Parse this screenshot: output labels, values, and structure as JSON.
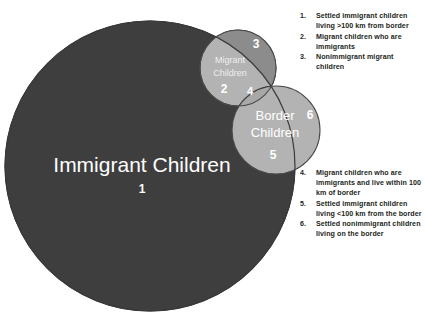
{
  "diagram": {
    "type": "euler-venn",
    "background_color": "#ffffff",
    "sets": [
      {
        "id": "immigrant-children",
        "label": "Immigrant Children",
        "region_number": "1",
        "fill_color": "#3e3e3e",
        "label_color": "#ffffff"
      },
      {
        "id": "migrant-children",
        "label": "Migrant Children",
        "label_line1": "Migrant",
        "label_line2": "Children",
        "region_number": "2",
        "fill_color": "#b3b3b3",
        "label_color": "#ffffff"
      },
      {
        "id": "border-children",
        "label": "Border Children",
        "label_line1": "Border",
        "label_line2": "Children",
        "region_number": "5",
        "fill_color": "#b3b3b3",
        "label_color": "#ffffff"
      }
    ],
    "region_labels": [
      {
        "number": "1",
        "color": "#ffffff"
      },
      {
        "number": "2",
        "color": "#ffffff"
      },
      {
        "number": "3",
        "color": "#ffffff"
      },
      {
        "number": "4",
        "color": "#ffffff"
      },
      {
        "number": "5",
        "color": "#ffffff"
      },
      {
        "number": "6",
        "color": "#ffffff"
      }
    ]
  },
  "legend_top": {
    "items": [
      {
        "number": "1.",
        "text": "Settled immigrant children living >100 km from border"
      },
      {
        "number": "2.",
        "text": "Migrant children who are immigrants"
      },
      {
        "number": "3.",
        "text": "Nonimmigrant migrant children"
      }
    ]
  },
  "legend_bottom": {
    "items": [
      {
        "number": "4.",
        "text": "Migrant children who are immigrants and live within 100 km of border"
      },
      {
        "number": "5.",
        "text": "Settled immigrant children living <100 km from the border"
      },
      {
        "number": "6.",
        "text": "Settled nonimmigrant children living on the border"
      }
    ]
  }
}
